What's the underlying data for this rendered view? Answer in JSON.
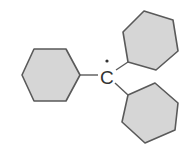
{
  "diagram": {
    "central_atom": {
      "label": "C",
      "radical_dot": true
    },
    "substituents": [
      {
        "name": "phenyl-left",
        "type": "hexagon"
      },
      {
        "name": "phenyl-upper-right",
        "type": "hexagon"
      },
      {
        "name": "phenyl-lower-right",
        "type": "hexagon"
      }
    ],
    "colors": {
      "ring_fill": "#d6d6d6",
      "stroke": "#5a5a5a",
      "text": "#333333",
      "background": "#ffffff"
    }
  }
}
